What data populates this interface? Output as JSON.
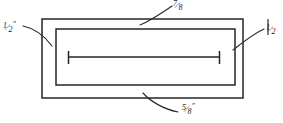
{
  "drawing": {
    "title": "Dimensioned rectangular frame detail",
    "background_color": "#ffffff",
    "line_color": "#26262b",
    "canvas": {
      "width": 283,
      "height": 123
    },
    "shapes": {
      "outer_rectangle": {
        "x": 42,
        "y": 19,
        "width": 201,
        "height": 79
      },
      "inner_rectangle": {
        "x": 56,
        "y": 29,
        "width": 179,
        "height": 56
      },
      "dimension_line": {
        "x1": 68,
        "x2": 220,
        "y": 57,
        "tick_height": 13
      }
    },
    "labels": {
      "top": {
        "numerator": "7",
        "bar": "/",
        "denominator": "8",
        "unit": "",
        "text": "7/8"
      },
      "bottom": {
        "numerator": "5",
        "bar": "/",
        "denominator": "8",
        "unit": "″",
        "text": "5/8″"
      },
      "left": {
        "numerator": "1",
        "bar": "/",
        "denominator": "2",
        "unit": "″",
        "text": "1/2″"
      },
      "right": {
        "numerator": "1",
        "bar": "/",
        "denominator": "2",
        "unit": "",
        "text": "1/2"
      }
    }
  }
}
